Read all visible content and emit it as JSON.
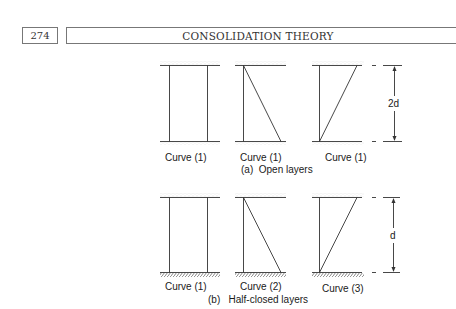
{
  "header": {
    "page_number": "274",
    "running_title": "CONSOLIDATION THEORY"
  },
  "figure": {
    "row_a": {
      "caption": "(a)  Open layers",
      "curves": [
        {
          "label": "Curve (1)",
          "shape": "rectangle"
        },
        {
          "label": "Curve (1)",
          "shape": "triangle-left-top"
        },
        {
          "label": "Curve (1)",
          "shape": "triangle-right-top"
        }
      ],
      "boundary_top": "drainage (open)",
      "boundary_bottom": "drainage (open)",
      "dimension_label": "2d"
    },
    "row_b": {
      "caption": "(b)   Half-closed layers",
      "curves": [
        {
          "label": "Curve (1)",
          "shape": "rectangle"
        },
        {
          "label": "Curve (2)",
          "shape": "triangle-left-top"
        },
        {
          "label": "Curve (3)",
          "shape": "triangle-right-top"
        }
      ],
      "boundary_top": "drainage (open)",
      "boundary_bottom": "impermeable (hatched)",
      "dimension_label": "d"
    }
  }
}
